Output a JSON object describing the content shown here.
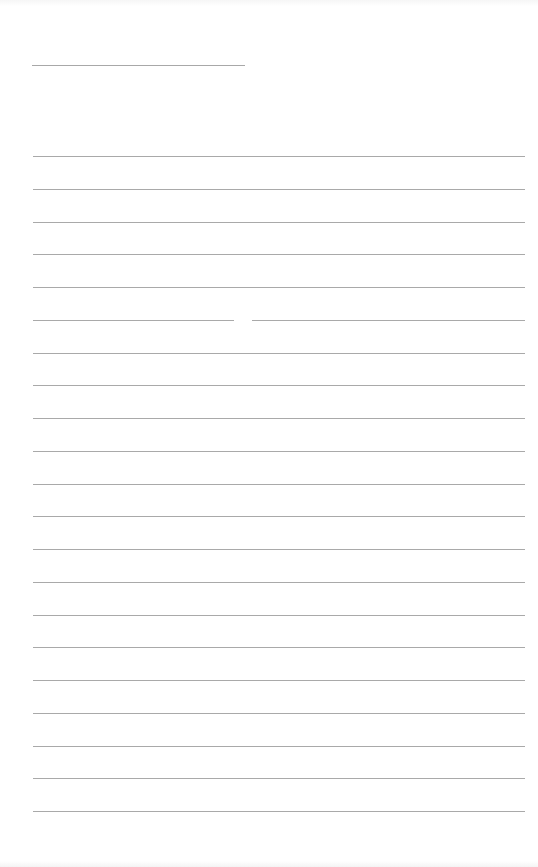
{
  "document": {
    "type": "lined-paper",
    "title_line": {
      "x": 32,
      "y": 65,
      "width": 213
    },
    "rules": {
      "count": 21,
      "first_y": 156,
      "spacing": 32.75,
      "x": 33,
      "width": 492,
      "color": "#a9a9a9"
    },
    "gaps": [
      {
        "rule_index": 5,
        "x": 234,
        "width": 18
      }
    ]
  }
}
